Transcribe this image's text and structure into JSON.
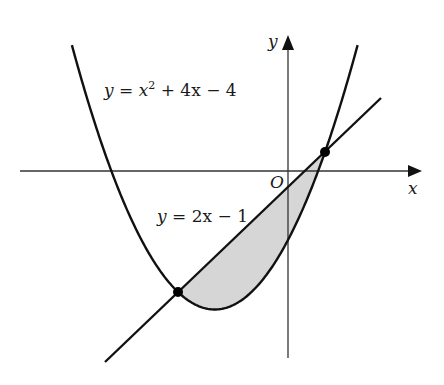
{
  "diagram": {
    "colors": {
      "stroke": "#111111",
      "axis": "#333333",
      "shade": "#d6d6d6",
      "background": "#ffffff"
    },
    "axes": {
      "x_label": "x",
      "y_label": "y",
      "origin_label": "O"
    },
    "curves": [
      {
        "name": "parabola",
        "equation": "y = x^2 + 4x - 4",
        "label_parts": {
          "y": "y",
          "eq": "=",
          "x": "x",
          "sup": "2",
          "rest": "+ 4x − 4"
        }
      },
      {
        "name": "line",
        "equation": "y = 2x - 1",
        "label_parts": {
          "y": "y",
          "eq": "=",
          "rest": "2x − 1"
        }
      }
    ],
    "intersection_points": [
      {
        "x": -3,
        "y": -7
      },
      {
        "x": 1,
        "y": 1
      }
    ],
    "shaded_region": "between y = 2x - 1 (above) and y = x^2 + 4x - 4 (below) for -3 <= x <= 1",
    "scale": {
      "origin_px": [
        288.25,
        169.5
      ],
      "px_per_unit_x": 36.75,
      "px_per_unit_y": 17.5
    }
  }
}
